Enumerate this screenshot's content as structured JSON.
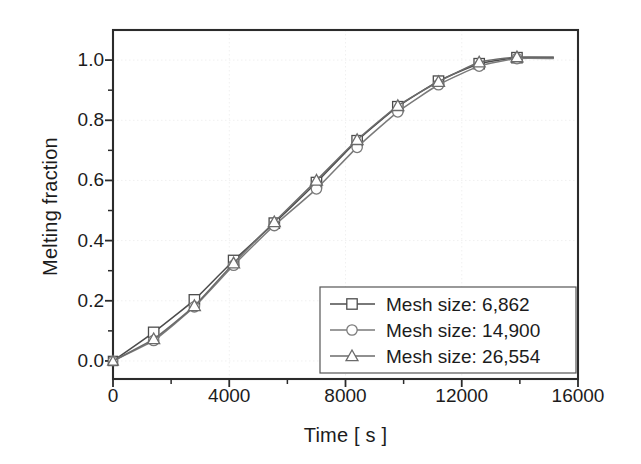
{
  "chart_data": {
    "type": "line",
    "title": "",
    "xlabel": "Time [ s ]",
    "ylabel": "Melting fraction",
    "xlim": [
      0,
      16000
    ],
    "ylim": [
      -0.06,
      1.1
    ],
    "xticks": [
      0,
      4000,
      8000,
      12000,
      16000
    ],
    "xtick_labels": [
      "0",
      "4000",
      "8000",
      "12000",
      "16000"
    ],
    "yticks": [
      0.0,
      0.2,
      0.4,
      0.6,
      0.8,
      1.0
    ],
    "ytick_labels": [
      "0.0",
      "0.2",
      "0.4",
      "0.6",
      "0.8",
      "1.0"
    ],
    "minor_ticks": true,
    "grid": "faint-dotted",
    "legend_position": "lower-right",
    "series": [
      {
        "name": "Mesh size: 6,862",
        "marker": "square",
        "color": "#4c4c4c",
        "x": [
          0,
          1400,
          2800,
          4150,
          5550,
          7000,
          8400,
          9800,
          11200,
          12600,
          13900,
          15150
        ],
        "y": [
          0.0,
          0.095,
          0.203,
          0.334,
          0.458,
          0.593,
          0.732,
          0.845,
          0.93,
          0.988,
          1.008,
          1.008
        ]
      },
      {
        "name": "Mesh size: 14,900",
        "marker": "circle",
        "color": "#7a7a7a",
        "x": [
          0,
          1400,
          2800,
          4150,
          5550,
          7000,
          8400,
          9800,
          11200,
          12600,
          13900,
          15150
        ],
        "y": [
          0.0,
          0.068,
          0.18,
          0.318,
          0.45,
          0.572,
          0.71,
          0.828,
          0.918,
          0.98,
          1.005,
          1.005
        ]
      },
      {
        "name": "Mesh size: 26,554",
        "marker": "triangle",
        "color": "#6b6b6b",
        "x": [
          0,
          1400,
          2800,
          4150,
          5550,
          7000,
          8400,
          9800,
          11200,
          12600,
          13900,
          15150
        ],
        "y": [
          0.0,
          0.073,
          0.183,
          0.325,
          0.462,
          0.6,
          0.735,
          0.848,
          0.928,
          0.993,
          1.01,
          1.01
        ]
      }
    ]
  },
  "legend": {
    "entries": [
      {
        "label": "Mesh size: 6,862"
      },
      {
        "label": "Mesh size: 14,900"
      },
      {
        "label": "Mesh size: 26,554"
      }
    ]
  },
  "colors": {
    "axis": "#2b2b2b",
    "grid": "#f0f0f0",
    "background": "#ffffff",
    "text": "#1c1c1c"
  }
}
